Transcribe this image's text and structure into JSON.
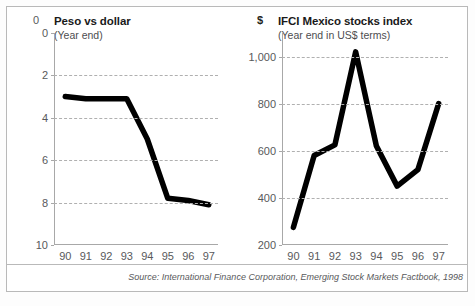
{
  "source": {
    "note": "Source: International Finance Corporation, Emerging Stock Markets Factbook, 1998"
  },
  "chart_data": [
    {
      "type": "line",
      "id": "peso-vs-dollar",
      "title": "Peso vs dollar",
      "subtitle": "(Year end)",
      "unit_label": "0",
      "xlabel": "",
      "ylabel": "",
      "categories": [
        "90",
        "91",
        "92",
        "93",
        "94",
        "95",
        "96",
        "97"
      ],
      "values": [
        3.0,
        3.1,
        3.1,
        3.1,
        5.0,
        7.8,
        7.9,
        8.1
      ],
      "yticks": [
        0,
        2,
        4,
        6,
        8,
        10
      ],
      "ytick_labels": [
        "0",
        "2",
        "4",
        "6",
        "8",
        "10"
      ],
      "ylim": [
        0,
        10
      ],
      "y_inverted": true,
      "grid": true,
      "grid_values": [
        2,
        4,
        6,
        8
      ],
      "legend": "none",
      "line_color": "#000000"
    },
    {
      "type": "line",
      "id": "ifci-mexico-stocks-index",
      "title": "IFCI Mexico stocks index",
      "subtitle": "(Year end in US$ terms)",
      "unit_label": "$",
      "xlabel": "",
      "ylabel": "",
      "categories": [
        "90",
        "91",
        "92",
        "93",
        "94",
        "95",
        "96",
        "97"
      ],
      "values": [
        275,
        580,
        625,
        1020,
        620,
        450,
        520,
        800
      ],
      "yticks": [
        200,
        400,
        600,
        800,
        1000
      ],
      "ytick_labels": [
        "200",
        "400",
        "600",
        "800",
        "1,000"
      ],
      "ylim": [
        200,
        1100
      ],
      "y_inverted": false,
      "grid": true,
      "grid_values": [
        400,
        600,
        800,
        1000
      ],
      "legend": "none",
      "line_color": "#000000"
    }
  ]
}
